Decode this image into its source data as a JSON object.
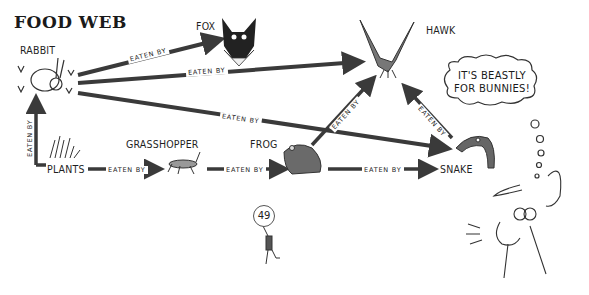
{
  "title": "FOOD WEB",
  "organisms": {
    "rabbit": "RABBIT",
    "fox": "FOX",
    "hawk": "HAWK",
    "plants": "PLANTS",
    "grasshopper": "GRASSHOPPER",
    "frog": "FROG",
    "snake": "SNAKE"
  },
  "relations": [
    {
      "from": "rabbit",
      "to": "fox",
      "label": "EATEN BY"
    },
    {
      "from": "rabbit",
      "to": "hawk",
      "label": "EATEN BY"
    },
    {
      "from": "rabbit",
      "to": "snake",
      "label": "EATEN BY"
    },
    {
      "from": "plants",
      "to": "rabbit",
      "label": "EATEN BY"
    },
    {
      "from": "plants",
      "to": "grasshopper",
      "label": "EATEN BY"
    },
    {
      "from": "grasshopper",
      "to": "frog",
      "label": "EATEN BY"
    },
    {
      "from": "frog",
      "to": "hawk",
      "label": "EATEN BY"
    },
    {
      "from": "frog",
      "to": "snake",
      "label": "EATEN BY"
    },
    {
      "from": "snake",
      "to": "hawk",
      "label": "EATEN BY"
    }
  ],
  "thought_bubble": {
    "line1": "IT'S BEASTLY",
    "line2": "FOR BUNNIES!"
  },
  "page_number": "49",
  "colors": {
    "arrow": "#3a3a3a",
    "ink": "#1f1f1f"
  }
}
